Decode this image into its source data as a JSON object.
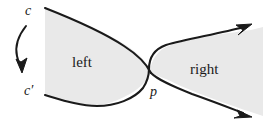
{
  "figure": {
    "canvas": {
      "width": 263,
      "height": 119
    },
    "colors": {
      "background": "#ffffff",
      "region_fill": "#e9e9e9",
      "stroke": "#1a1a1a",
      "text": "#1a1a1a"
    },
    "labels": {
      "c": "c",
      "c_prime": "c′",
      "p": "p",
      "left": "left",
      "right": "right"
    },
    "icons": {
      "rotation_arrow": "curved-down-arrow-icon",
      "upper_arrow": "arrow-up-right-icon",
      "lower_arrow": "arrow-down-right-icon"
    },
    "regions": [
      {
        "name": "left",
        "label": "left",
        "fill": "#e9e9e9"
      },
      {
        "name": "right",
        "label": "right",
        "fill": "#e9e9e9"
      }
    ]
  }
}
